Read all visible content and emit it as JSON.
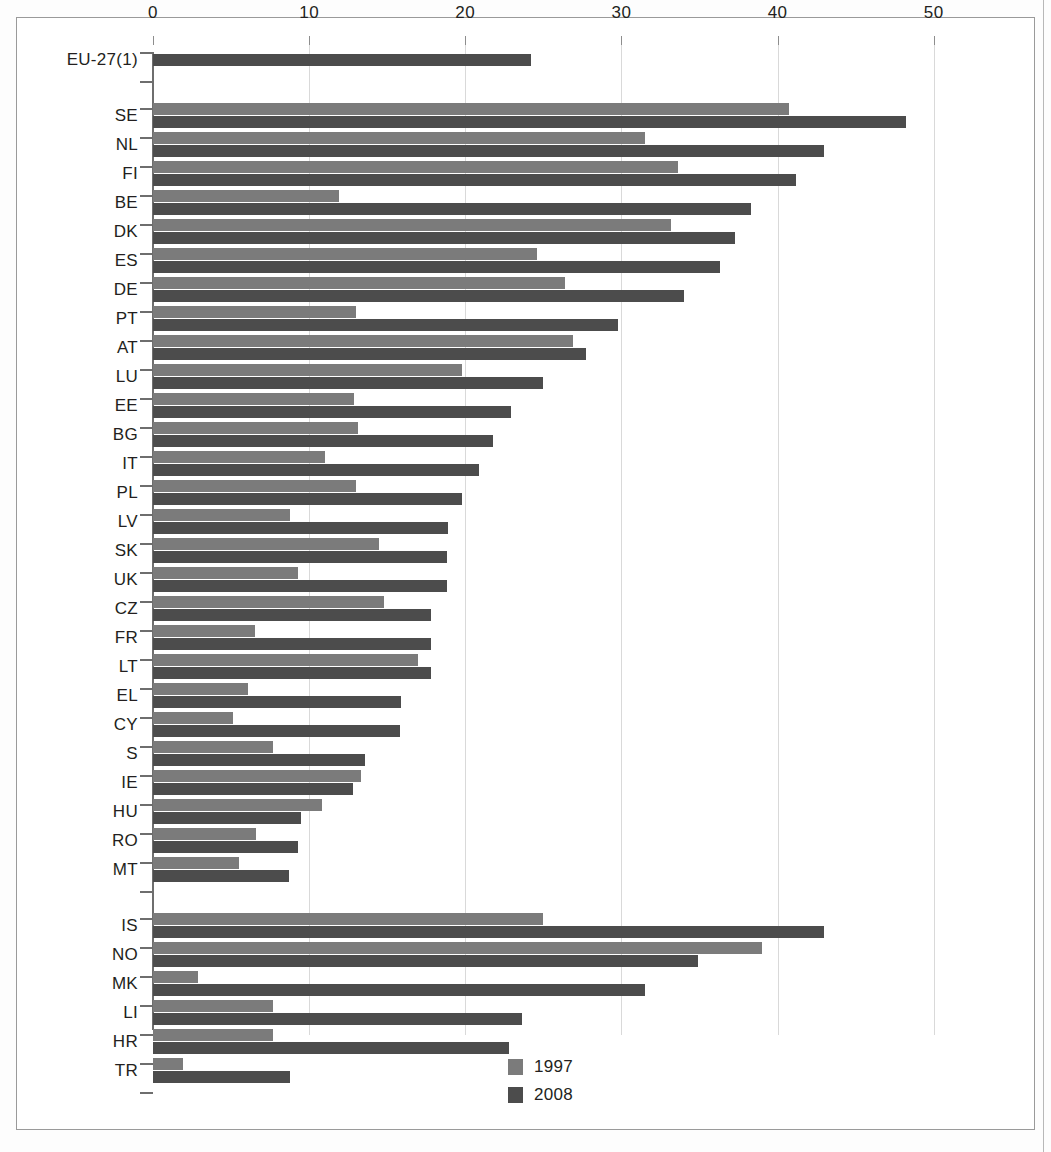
{
  "chart_data": {
    "type": "bar",
    "orientation": "horizontal",
    "title": "",
    "xlabel": "",
    "ylabel": "",
    "xlim": [
      0,
      52
    ],
    "grid": true,
    "legend_position": "bottom-center",
    "xticks": [
      "0",
      "10",
      "20",
      "30",
      "40",
      "50"
    ],
    "xtick_values": [
      0,
      10,
      20,
      30,
      40,
      50
    ],
    "series": [
      {
        "name": "1997",
        "color": "#7b7b7b"
      },
      {
        "name": "2008",
        "color": "#4c4c4c"
      }
    ],
    "groups": [
      {
        "name": "aggregate",
        "rows": [
          {
            "category": "EU-27(1)",
            "values": [
              null,
              24.2
            ]
          }
        ]
      },
      {
        "name": "member-states",
        "rows": [
          {
            "category": "SE",
            "values": [
              40.7,
              48.2
            ]
          },
          {
            "category": "NL",
            "values": [
              31.5,
              43.0
            ]
          },
          {
            "category": "FI",
            "values": [
              33.6,
              41.2
            ]
          },
          {
            "category": "BE",
            "values": [
              11.9,
              38.3
            ]
          },
          {
            "category": "DK",
            "values": [
              33.2,
              37.3
            ]
          },
          {
            "category": "ES",
            "values": [
              24.6,
              36.3
            ]
          },
          {
            "category": "DE",
            "values": [
              26.4,
              34.0
            ]
          },
          {
            "category": "PT",
            "values": [
              13.0,
              29.8
            ]
          },
          {
            "category": "AT",
            "values": [
              26.9,
              27.7
            ]
          },
          {
            "category": "LU",
            "values": [
              19.8,
              25.0
            ]
          },
          {
            "category": "EE",
            "values": [
              12.9,
              22.9
            ]
          },
          {
            "category": "BG",
            "values": [
              13.1,
              21.8
            ]
          },
          {
            "category": "IT",
            "values": [
              11.0,
              20.9
            ]
          },
          {
            "category": "PL",
            "values": [
              13.0,
              19.8
            ]
          },
          {
            "category": "LV",
            "values": [
              8.8,
              18.9
            ]
          },
          {
            "category": "SK",
            "values": [
              14.5,
              18.8
            ]
          },
          {
            "category": "UK",
            "values": [
              9.3,
              18.8
            ]
          },
          {
            "category": "CZ",
            "values": [
              14.8,
              17.8
            ]
          },
          {
            "category": "FR",
            "values": [
              6.5,
              17.8
            ]
          },
          {
            "category": "LT",
            "values": [
              17.0,
              17.8
            ]
          },
          {
            "category": "EL",
            "values": [
              6.1,
              15.9
            ]
          },
          {
            "category": "CY",
            "values": [
              5.1,
              15.8
            ]
          },
          {
            "category": "S",
            "values": [
              7.7,
              13.6
            ]
          },
          {
            "category": "IE",
            "values": [
              13.3,
              12.8
            ]
          },
          {
            "category": "HU",
            "values": [
              10.8,
              9.5
            ]
          },
          {
            "category": "RO",
            "values": [
              6.6,
              9.3
            ]
          },
          {
            "category": "MT",
            "values": [
              5.5,
              8.7
            ]
          }
        ]
      },
      {
        "name": "other-countries",
        "rows": [
          {
            "category": "IS",
            "values": [
              25.0,
              43.0
            ]
          },
          {
            "category": "NO",
            "values": [
              39.0,
              34.9
            ]
          },
          {
            "category": "MK",
            "values": [
              2.9,
              31.5
            ]
          },
          {
            "category": "LI",
            "values": [
              7.7,
              23.6
            ]
          },
          {
            "category": "HR",
            "values": [
              7.7,
              22.8
            ]
          },
          {
            "category": "TR",
            "values": [
              1.9,
              8.8
            ]
          }
        ]
      }
    ]
  },
  "legend": {
    "items": [
      {
        "label": "1997",
        "color": "#7b7b7b"
      },
      {
        "label": "2008",
        "color": "#4c4c4c"
      }
    ]
  }
}
